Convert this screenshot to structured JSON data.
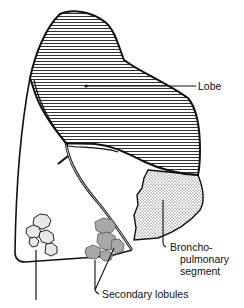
{
  "figure": {
    "type": "lung anatomy schematic",
    "labels": {
      "lobe": "Lobe",
      "segment_line1": "Broncho-",
      "segment_line2": "pulmonary",
      "segment_line3": "segment",
      "secondary": "Secondary lobules"
    },
    "colors": {
      "outline": "#111111",
      "hatch": "#333333",
      "lobule_fill": "#a8a8a8",
      "background": "#ffffff"
    }
  }
}
